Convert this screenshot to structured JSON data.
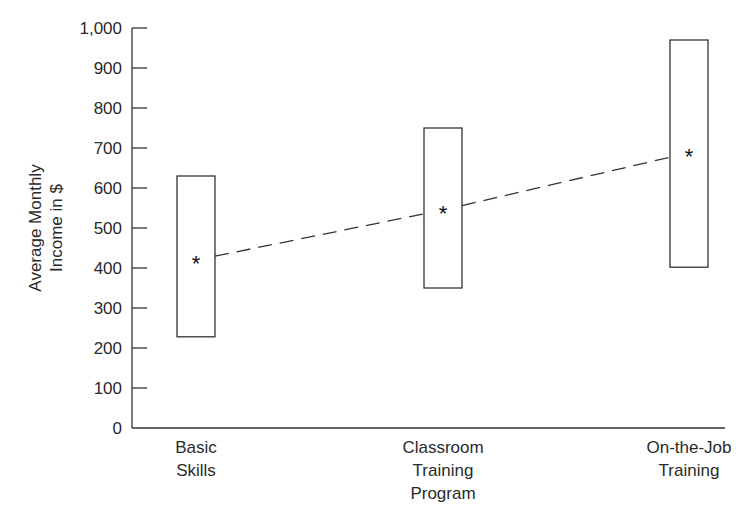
{
  "chart_data": {
    "type": "range-box",
    "title": "",
    "xlabel": "",
    "ylabel": "Average Monthly Income in $",
    "ylabel_lines": [
      "Average Monthly",
      "Income in $"
    ],
    "ylim": [
      0,
      1000
    ],
    "yticks": [
      0,
      100,
      200,
      300,
      400,
      500,
      600,
      700,
      800,
      900,
      1000
    ],
    "ytick_labels": [
      "0",
      "100",
      "200",
      "300",
      "400",
      "500",
      "600",
      "700",
      "800",
      "900",
      "1,000"
    ],
    "grid": false,
    "legend": null,
    "categories": [
      "Basic Skills",
      "Classroom Training Program",
      "On-the-Job Training"
    ],
    "category_label_lines": [
      [
        "Basic",
        "Skills"
      ],
      [
        "Classroom",
        "Training",
        "Program"
      ],
      [
        "On-the-Job",
        "Training"
      ]
    ],
    "series": [
      {
        "name": "Range low",
        "values": [
          228,
          350,
          402
        ]
      },
      {
        "name": "Range high",
        "values": [
          630,
          750,
          970
        ]
      },
      {
        "name": "Mean (*)",
        "values": [
          420,
          545,
          688
        ]
      }
    ],
    "trend_line": {
      "style": "dashed",
      "connects": "means"
    },
    "mean_marker": "*"
  }
}
